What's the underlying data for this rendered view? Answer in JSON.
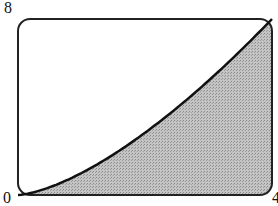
{
  "chart_data": {
    "type": "area",
    "title": "",
    "xlabel": "",
    "ylabel": "",
    "function": "y = x^(3/2)",
    "x": [
      0,
      0.5,
      1,
      1.5,
      2,
      2.5,
      3,
      3.5,
      4
    ],
    "values": [
      0,
      0.35,
      1,
      1.84,
      2.83,
      3.95,
      5.2,
      6.55,
      8
    ],
    "shaded_region": "area under curve from x=0 to x=4",
    "xlim": [
      0,
      4
    ],
    "ylim": [
      0,
      8
    ],
    "tick_labels": {
      "origin": "0",
      "x_max": "4",
      "y_max": "8"
    },
    "grid": false,
    "legend": null
  },
  "labels": {
    "origin": "0",
    "x_max": "4",
    "y_max": "8"
  },
  "colors": {
    "curve": "#111111",
    "fill": "#b8b8b8",
    "frame": "#222222"
  }
}
